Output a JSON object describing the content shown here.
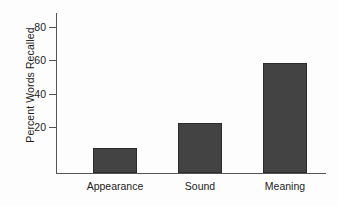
{
  "chart_data": {
    "type": "bar",
    "title": "",
    "xlabel": "",
    "ylabel": "Percent Words Recalled",
    "categories": [
      "Appearance",
      "Sound",
      "Meaning"
    ],
    "values": [
      15,
      30,
      66
    ],
    "ylim": [
      0,
      88
    ],
    "yticks": [
      20,
      40,
      60,
      80
    ],
    "ytick_labels": [
      "20",
      "40",
      "60",
      "80"
    ],
    "grid": false,
    "legend": null,
    "series": [
      {
        "name": "Percent Words Recalled",
        "values": [
          15,
          30,
          66
        ],
        "color": "#434343"
      }
    ],
    "colors": {
      "bar_fill": "#434343",
      "bar_edge": "#2b2b2b",
      "axis": "#555555",
      "text": "#1c1c1c",
      "background": "#fdfdfd"
    }
  },
  "axis": {
    "y_title": "Percent Words Recalled",
    "ticks": [
      {
        "label": "80",
        "value": 80
      },
      {
        "label": "60",
        "value": 60
      },
      {
        "label": "40",
        "value": 40
      },
      {
        "label": "20",
        "value": 20
      }
    ]
  },
  "bars": [
    {
      "label": "Appearance",
      "value": 15
    },
    {
      "label": "Sound",
      "value": 30
    },
    {
      "label": "Meaning",
      "value": 66
    }
  ]
}
